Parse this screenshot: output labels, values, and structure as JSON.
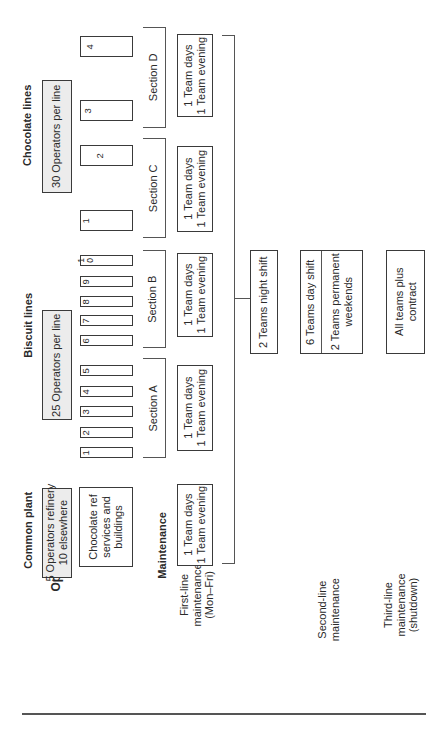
{
  "row_labels": {
    "operations": "Operations",
    "maintenance": "Maintenance",
    "first_line": [
      "First-line",
      "maintenance",
      "(Mon–Fri)"
    ],
    "second_line": [
      "Second-line",
      "maintenance"
    ],
    "third_line": [
      "Third-line",
      "maintenance",
      "(shutdown)"
    ]
  },
  "common_plant": {
    "title": "Common plant",
    "operators": [
      "5 Operators refinery",
      "10 elsewhere"
    ],
    "area": [
      "Chocolate ref",
      "services and",
      "buildings"
    ],
    "first_line_teams": [
      "1 Team days",
      "1 Team evening"
    ]
  },
  "biscuit_lines": {
    "title": "Biscuit lines",
    "operators": "25 Operators per line",
    "lines": [
      "1",
      "2",
      "3",
      "4",
      "5",
      "6",
      "7",
      "8",
      "9",
      "1\n0"
    ],
    "sections": [
      {
        "name": "Section A",
        "teams": [
          "1 Team days",
          "1 Team evening"
        ]
      },
      {
        "name": "Section B",
        "teams": [
          "1 Team days",
          "1 Team evening"
        ]
      }
    ]
  },
  "chocolate_lines": {
    "title": "Chocolate lines",
    "operators": "30 Operators per line",
    "lines": [
      "1",
      "2",
      "3",
      "4"
    ],
    "sections": [
      {
        "name": "Section C",
        "teams": [
          "1 Team days",
          "1 Team evening"
        ]
      },
      {
        "name": "Section D",
        "teams": [
          "1 Team days",
          "1 Team evening"
        ]
      }
    ]
  },
  "second_line_boxes": {
    "night": "2 Teams night shift",
    "day": "6 Teams day shift",
    "weekends": [
      "2 Teams permanent",
      "weekends"
    ]
  },
  "third_line_box": [
    "All teams plus",
    "contract"
  ]
}
